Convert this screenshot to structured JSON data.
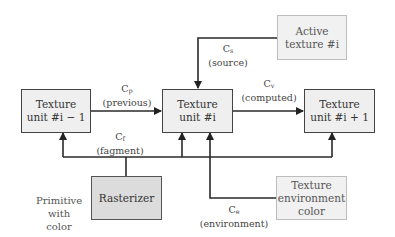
{
  "diagram": {
    "boxes": {
      "unit_prev": {
        "line1": "Texture",
        "line2": "unit #i − 1"
      },
      "unit_cur": {
        "line1": "Texture",
        "line2": "unit #i"
      },
      "unit_next": {
        "line1": "Texture",
        "line2": "unit #i + 1"
      },
      "active": {
        "line1": "Active",
        "line2": "texture #i"
      },
      "rasterizer": {
        "line1": "Rasterizer"
      },
      "env": {
        "line1": "Texture",
        "line2": "environment",
        "line3": "color"
      }
    },
    "labels": {
      "cp": {
        "base": "C",
        "sub": "p",
        "desc": "(previous)"
      },
      "cs": {
        "base": "C",
        "sub": "s",
        "desc": "(source)"
      },
      "cv": {
        "base": "C",
        "sub": "v",
        "desc": "(computed)"
      },
      "cf": {
        "base": "C",
        "sub": "f",
        "desc": "(fagment)"
      },
      "ce": {
        "base": "C",
        "sub": "e",
        "desc": "(environment)"
      }
    },
    "note": {
      "line1": "Primitive",
      "line2": "with color"
    },
    "colors": {
      "line": "#2a2a2a",
      "box_fill": "#efefef",
      "rasterizer_fill": "#dcdcdc",
      "light_border": "#bdbdbd"
    }
  }
}
